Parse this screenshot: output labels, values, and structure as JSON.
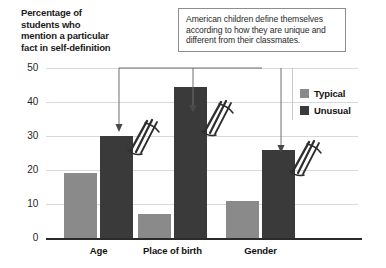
{
  "chart_data": {
    "type": "bar",
    "title": "Percentage of students who mention a particular fact in self-definition",
    "xlabel": "",
    "ylabel": "Percentage of students who mention a particular fact in self-definition",
    "categories": [
      "Age",
      "Place of birth",
      "Gender"
    ],
    "series": [
      {
        "name": "Typical",
        "color": "#8a8a8a",
        "values": [
          19,
          7,
          11
        ]
      },
      {
        "name": "Unusual",
        "color": "#3a3a3a",
        "values": [
          30,
          44.5,
          26
        ]
      }
    ],
    "ylim": [
      0,
      50
    ],
    "yticks": [
      0,
      10,
      20,
      30,
      40,
      50
    ],
    "ytick_labels": [
      "0",
      "10",
      "20",
      "30",
      "40",
      "50"
    ],
    "grid": true,
    "legend_position": "top-right",
    "annotations": [
      {
        "text": "American children define themselves according to how they are unique and different from their classmates.",
        "points_to": [
          "Unusual:Age",
          "Unusual:Place of birth",
          "Unusual:Gender"
        ]
      }
    ]
  },
  "axis_title": {
    "line1": "Percentage of",
    "line2": "students who",
    "line3": "mention a particular",
    "line4": "fact in self-definition"
  },
  "callout": {
    "text": "American children define themselves according to how they are unique and different from their classmates."
  },
  "legend": {
    "items": [
      {
        "label": "Typical"
      },
      {
        "label": "Unusual"
      }
    ]
  },
  "colors": {
    "typical": "#8a8a8a",
    "unusual": "#3a3a3a",
    "axis": "#2b2b2b",
    "grid": "#d9d9d9",
    "callout_border": "#8d8d8d"
  }
}
